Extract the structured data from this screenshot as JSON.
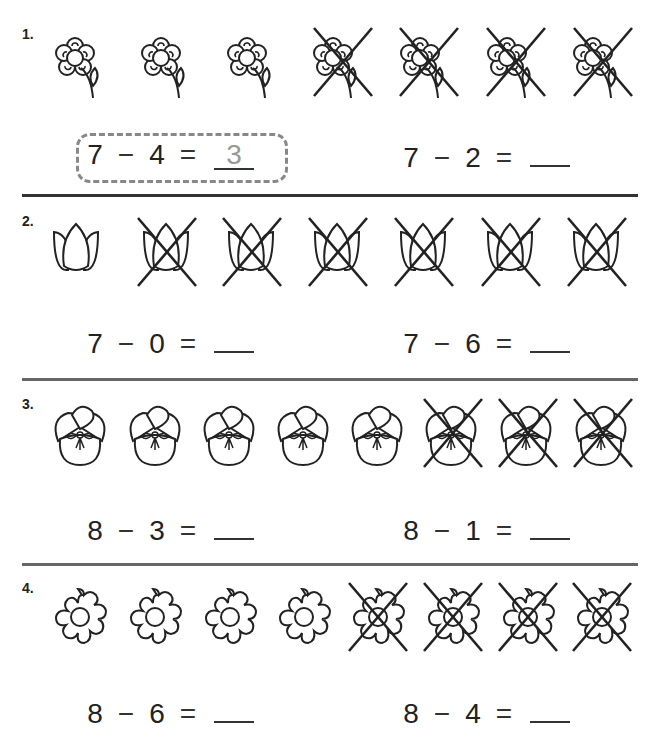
{
  "worksheet": {
    "problems": [
      {
        "number": "1.",
        "picture": "flower-with-stem",
        "total": 7,
        "crossed": 4,
        "equations": [
          {
            "a": "7",
            "op": "−",
            "b": "4",
            "eq": "=",
            "answer": "3",
            "is_example": true
          },
          {
            "a": "7",
            "op": "−",
            "b": "2",
            "eq": "=",
            "answer": ""
          }
        ]
      },
      {
        "number": "2.",
        "picture": "tulip",
        "total": 7,
        "crossed": 6,
        "equations": [
          {
            "a": "7",
            "op": "−",
            "b": "0",
            "eq": "=",
            "answer": ""
          },
          {
            "a": "7",
            "op": "−",
            "b": "6",
            "eq": "=",
            "answer": ""
          }
        ]
      },
      {
        "number": "3.",
        "picture": "pansy",
        "total": 8,
        "crossed": 3,
        "equations": [
          {
            "a": "8",
            "op": "−",
            "b": "3",
            "eq": "=",
            "answer": ""
          },
          {
            "a": "8",
            "op": "−",
            "b": "1",
            "eq": "=",
            "answer": ""
          }
        ]
      },
      {
        "number": "4.",
        "picture": "daisy",
        "total": 8,
        "crossed": 4,
        "equations": [
          {
            "a": "8",
            "op": "−",
            "b": "6",
            "eq": "=",
            "answer": ""
          },
          {
            "a": "8",
            "op": "−",
            "b": "4",
            "eq": "=",
            "answer": ""
          }
        ]
      }
    ]
  }
}
